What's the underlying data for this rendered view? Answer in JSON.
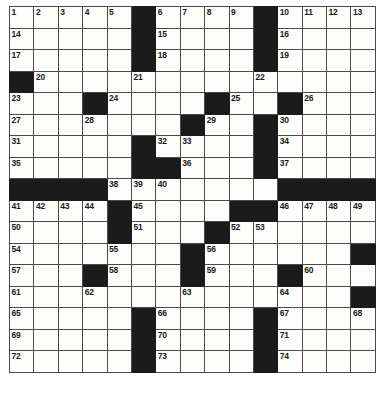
{
  "puzzle": {
    "title": "Crossword Grid",
    "rows": 17,
    "cols": 15,
    "colors": {
      "block": "#1b1b1b",
      "cell": "#fdfdfc",
      "gridline": "#4a4a4a",
      "outer_border": "#111111",
      "number_text": "#1a1a1a",
      "page_background": "#ffffff"
    },
    "numbering_style": "standard-crossword",
    "highest_number": 79,
    "black_squares": [
      [
        1,
        6
      ],
      [
        1,
        11
      ],
      [
        2,
        6
      ],
      [
        2,
        11
      ],
      [
        3,
        6
      ],
      [
        3,
        11
      ],
      [
        4,
        1
      ],
      [
        5,
        4
      ],
      [
        5,
        9
      ],
      [
        5,
        12
      ],
      [
        6,
        8
      ],
      [
        6,
        11
      ],
      [
        7,
        6
      ],
      [
        7,
        11
      ],
      [
        8,
        6
      ],
      [
        8,
        7
      ],
      [
        8,
        11
      ],
      [
        9,
        1
      ],
      [
        9,
        2
      ],
      [
        9,
        3
      ],
      [
        9,
        4
      ],
      [
        9,
        12
      ],
      [
        9,
        13
      ],
      [
        9,
        14
      ],
      [
        9,
        15
      ],
      [
        10,
        5
      ],
      [
        10,
        10
      ],
      [
        10,
        11
      ],
      [
        11,
        5
      ],
      [
        11,
        9
      ],
      [
        12,
        8
      ],
      [
        12,
        15
      ],
      [
        13,
        4
      ],
      [
        13,
        8
      ],
      [
        13,
        12
      ],
      [
        14,
        15
      ],
      [
        15,
        6
      ],
      [
        15,
        11
      ],
      [
        16,
        6
      ],
      [
        16,
        11
      ],
      [
        17,
        6
      ],
      [
        17,
        11
      ]
    ],
    "numbered_cells": [
      {
        "n": 1,
        "row": 1,
        "col": 1
      },
      {
        "n": 2,
        "row": 1,
        "col": 2
      },
      {
        "n": 3,
        "row": 1,
        "col": 3
      },
      {
        "n": 4,
        "row": 1,
        "col": 4
      },
      {
        "n": 5,
        "row": 1,
        "col": 5
      },
      {
        "n": 6,
        "row": 1,
        "col": 7
      },
      {
        "n": 7,
        "row": 1,
        "col": 8
      },
      {
        "n": 8,
        "row": 1,
        "col": 9
      },
      {
        "n": 9,
        "row": 1,
        "col": 10
      },
      {
        "n": 10,
        "row": 1,
        "col": 11
      },
      {
        "n": 11,
        "row": 1,
        "col": 12
      },
      {
        "n": 12,
        "row": 1,
        "col": 13
      },
      {
        "n": 13,
        "row": 1,
        "col": 14
      },
      {
        "n": 14,
        "row": 1,
        "col": 15
      },
      {
        "n": 15,
        "row": 1,
        "col": 16
      },
      {
        "n": 16,
        "row": 2,
        "col": 1
      },
      {
        "n": 17,
        "row": 2,
        "col": 7
      },
      {
        "n": 18,
        "row": 2,
        "col": 12
      },
      {
        "n": 19,
        "row": 3,
        "col": 1
      },
      {
        "n": 20,
        "row": 3,
        "col": 7
      },
      {
        "n": 21,
        "row": 3,
        "col": 12
      },
      {
        "n": 22,
        "row": 4,
        "col": 2
      },
      {
        "n": 23,
        "row": 4,
        "col": 7
      },
      {
        "n": 24,
        "row": 4,
        "col": 12
      },
      {
        "n": 25,
        "row": 5,
        "col": 1
      },
      {
        "n": 26,
        "row": 5,
        "col": 6
      },
      {
        "n": 27,
        "row": 5,
        "col": 11
      },
      {
        "n": 28,
        "row": 5,
        "col": 14
      },
      {
        "n": 29,
        "row": 6,
        "col": 1
      },
      {
        "n": 30,
        "row": 6,
        "col": 4
      },
      {
        "n": 31,
        "row": 6,
        "col": 5
      },
      {
        "n": 32,
        "row": 6,
        "col": 10
      },
      {
        "n": 33,
        "row": 6,
        "col": 13
      },
      {
        "n": 34,
        "row": 7,
        "col": 1
      },
      {
        "n": 35,
        "row": 7,
        "col": 8
      },
      {
        "n": 36,
        "row": 7,
        "col": 13
      },
      {
        "n": 37,
        "row": 8,
        "col": 1
      },
      {
        "n": 38,
        "row": 8,
        "col": 9
      },
      {
        "n": 39,
        "row": 8,
        "col": 13
      },
      {
        "n": 40,
        "row": 9,
        "col": 6
      },
      {
        "n": 41,
        "row": 9,
        "col": 7
      },
      {
        "n": 42,
        "row": 9,
        "col": 8
      },
      {
        "n": 43,
        "row": 9,
        "col": 13
      },
      {
        "n": 44,
        "row": 10,
        "col": 1
      },
      {
        "n": 45,
        "row": 10,
        "col": 2
      },
      {
        "n": 46,
        "row": 10,
        "col": 3
      },
      {
        "n": 47,
        "row": 10,
        "col": 4
      },
      {
        "n": 48,
        "row": 10,
        "col": 6
      },
      {
        "n": 49,
        "row": 10,
        "col": 12
      },
      {
        "n": 50,
        "row": 10,
        "col": 13
      },
      {
        "n": 51,
        "row": 10,
        "col": 14
      },
      {
        "n": 52,
        "row": 10,
        "col": 15
      },
      {
        "n": 53,
        "row": 10,
        "col": 16
      },
      {
        "n": 54,
        "row": 11,
        "col": 1
      },
      {
        "n": 55,
        "row": 11,
        "col": 6
      },
      {
        "n": 56,
        "row": 11,
        "col": 10
      },
      {
        "n": 57,
        "row": 11,
        "col": 11
      },
      {
        "n": 58,
        "row": 12,
        "col": 1
      },
      {
        "n": 59,
        "row": 12,
        "col": 5
      },
      {
        "n": 60,
        "row": 12,
        "col": 9
      },
      {
        "n": 61,
        "row": 13,
        "col": 1
      },
      {
        "n": 62,
        "row": 13,
        "col": 5
      },
      {
        "n": 63,
        "row": 13,
        "col": 9
      },
      {
        "n": 64,
        "row": 13,
        "col": 13
      },
      {
        "n": 65,
        "row": 14,
        "col": 1
      },
      {
        "n": 66,
        "row": 14,
        "col": 4
      },
      {
        "n": 67,
        "row": 14,
        "col": 8
      },
      {
        "n": 68,
        "row": 14,
        "col": 12
      },
      {
        "n": 69,
        "row": 14,
        "col": 13
      },
      {
        "n": 70,
        "row": 15,
        "col": 1
      },
      {
        "n": 71,
        "row": 15,
        "col": 7
      },
      {
        "n": 72,
        "row": 15,
        "col": 12
      },
      {
        "n": 73,
        "row": 15,
        "col": 16
      },
      {
        "n": 74,
        "row": 16,
        "col": 1
      },
      {
        "n": 75,
        "row": 16,
        "col": 7
      },
      {
        "n": 76,
        "row": 16,
        "col": 12
      },
      {
        "n": 77,
        "row": 17,
        "col": 1
      },
      {
        "n": 78,
        "row": 17,
        "col": 7
      },
      {
        "n": 79,
        "row": 17,
        "col": 12
      }
    ]
  }
}
